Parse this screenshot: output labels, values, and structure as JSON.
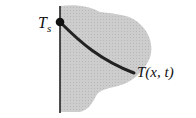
{
  "diagram": {
    "surface_label": "T",
    "surface_label_subscript": "s",
    "profile_label": "T(x, t)",
    "colors": {
      "region_fill": "#c9c9c9",
      "boundary_line": "#222222",
      "curve": "#222222",
      "text": "#111111"
    }
  }
}
